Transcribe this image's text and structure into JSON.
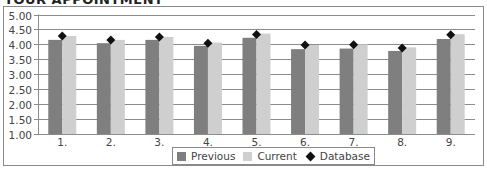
{
  "chart_data": {
    "type": "bar",
    "title": "YOUR APPOINTMENT",
    "xlabel": "",
    "ylabel": "",
    "ylim": [
      1.0,
      5.0
    ],
    "yticks": [
      "5.00",
      "4.50",
      "4.00",
      "3.50",
      "3.00",
      "2.50",
      "2.00",
      "1.50",
      "1.00"
    ],
    "ytick_values": [
      5.0,
      4.5,
      4.0,
      3.5,
      3.0,
      2.5,
      2.0,
      1.5,
      1.0
    ],
    "grid": true,
    "legend_position": "bottom",
    "categories": [
      "1.",
      "2.",
      "3.",
      "4.",
      "5.",
      "6.",
      "7.",
      "8.",
      "9."
    ],
    "series": [
      {
        "name": "Previous",
        "kind": "bar",
        "color": "#7f7f7f",
        "values": [
          4.15,
          4.04,
          4.15,
          3.95,
          4.22,
          3.84,
          3.86,
          3.78,
          4.18
        ]
      },
      {
        "name": "Current",
        "kind": "bar",
        "color": "#cfcfcf",
        "values": [
          4.28,
          4.15,
          4.25,
          4.06,
          4.36,
          3.98,
          4.0,
          3.9,
          4.34
        ]
      },
      {
        "name": "Database",
        "kind": "marker",
        "color": "#111111",
        "values": [
          4.28,
          4.15,
          4.25,
          4.04,
          4.33,
          3.98,
          3.99,
          3.88,
          4.32
        ]
      }
    ]
  },
  "legend": {
    "items": [
      {
        "label": "Previous",
        "color": "#7f7f7f",
        "shape": "square"
      },
      {
        "label": "Current",
        "color": "#cfcfcf",
        "shape": "square"
      },
      {
        "label": "Database",
        "color": "#111111",
        "shape": "diamond"
      }
    ]
  }
}
